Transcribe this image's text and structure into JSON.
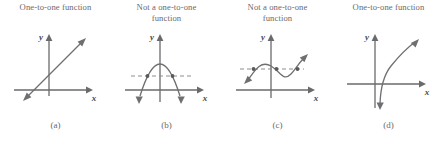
{
  "figure": {
    "name": "one-to-one-function-examples",
    "background_color": "#ffffff",
    "stroke_color": "#6f6f72",
    "axis_color": "#6a6a6c",
    "text_color": "#6a6a6c",
    "dashed_color": "#8d8d90",
    "panels": [
      {
        "id": "a",
        "caption": "One-to-one function",
        "label": "(a)",
        "axis_x_label": "x",
        "axis_y_label": "y",
        "curve_type": "line",
        "has_horizontal_test_line": false,
        "intersection_count": 1,
        "is_one_to_one": true
      },
      {
        "id": "b",
        "caption": "Not a one-to-one\nfunction",
        "label": "(b)",
        "axis_x_label": "x",
        "axis_y_label": "y",
        "curve_type": "parabola",
        "has_horizontal_test_line": true,
        "intersection_count": 2,
        "is_one_to_one": false
      },
      {
        "id": "c",
        "caption": "Not a one-to-one\nfunction",
        "label": "(c)",
        "axis_x_label": "x",
        "axis_y_label": "y",
        "curve_type": "cubic",
        "has_horizontal_test_line": true,
        "intersection_count": 3,
        "is_one_to_one": false
      },
      {
        "id": "d",
        "caption": "One-to-one function",
        "label": "(d)",
        "axis_x_label": "x",
        "axis_y_label": "y",
        "curve_type": "logarithmic",
        "has_horizontal_test_line": false,
        "intersection_count": 1,
        "is_one_to_one": true
      }
    ]
  }
}
